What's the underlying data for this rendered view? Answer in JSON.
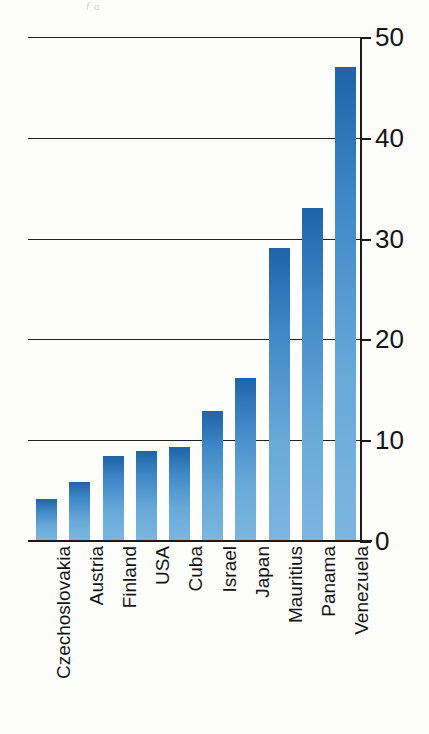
{
  "page": {
    "artifact_text": "f g"
  },
  "chart_data": {
    "type": "bar",
    "title": "",
    "subtitle": "",
    "xlabel": "",
    "ylabel": "",
    "ylim": [
      0,
      50
    ],
    "yticks": [
      0,
      10,
      20,
      30,
      40,
      50
    ],
    "ytick_labels": [
      "0",
      "10",
      "20",
      "30",
      "40",
      "50"
    ],
    "grid": true,
    "grid_axis": "y",
    "legend": false,
    "legend_position": "none",
    "axis_position": "right",
    "label_rotation": -90,
    "categories": [
      "Czechoslovakia",
      "Austria",
      "Finland",
      "USA",
      "Cuba",
      "Israel",
      "Japan",
      "Mauritius",
      "Panama",
      "Venezuela"
    ],
    "values": [
      4.2,
      5.9,
      8.4,
      8.9,
      9.3,
      12.9,
      16.2,
      29.1,
      33,
      47
    ],
    "colors": {
      "bar_top": "#1f63a8",
      "bar_bottom": "#7cb6df",
      "axis": "#1d1b19",
      "grid": "#23211f",
      "background": "#fdfdfc",
      "text": "#141312"
    }
  }
}
